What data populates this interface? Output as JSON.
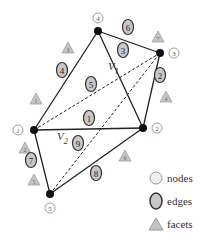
{
  "diagram": {
    "nodes": [
      {
        "id": "1",
        "label": "1",
        "x": 34,
        "y": 130,
        "lx": 18,
        "ly": 130
      },
      {
        "id": "2",
        "label": "2",
        "x": 143,
        "y": 128,
        "lx": 157,
        "ly": 128
      },
      {
        "id": "3",
        "label": "3",
        "x": 160,
        "y": 53,
        "lx": 174,
        "ly": 53
      },
      {
        "id": "4",
        "label": "4",
        "x": 98,
        "y": 31,
        "lx": 98,
        "ly": 18
      },
      {
        "id": "5",
        "label": "5",
        "x": 50,
        "y": 194,
        "lx": 50,
        "ly": 208
      }
    ],
    "edges": [
      {
        "id": "1",
        "label": "1",
        "from": "1",
        "to": "2",
        "style": "solid",
        "lx": 89,
        "ly": 118
      },
      {
        "id": "2",
        "label": "2",
        "from": "2",
        "to": "3",
        "style": "solid",
        "lx": 160,
        "ly": 75
      },
      {
        "id": "3",
        "label": "3",
        "from": "4",
        "to": "3",
        "style": "solid",
        "lx": 123,
        "ly": 50
      },
      {
        "id": "4",
        "label": "4",
        "from": "1",
        "to": "4",
        "style": "solid",
        "lx": 62,
        "ly": 70
      },
      {
        "id": "5",
        "label": "5",
        "from": "1",
        "to": "3",
        "style": "dashed",
        "lx": 91,
        "ly": 84
      },
      {
        "id": "6",
        "label": "6",
        "from": "4",
        "to": "2",
        "style": "solid",
        "lx": 128,
        "ly": 27
      },
      {
        "id": "7",
        "label": "7",
        "from": "1",
        "to": "5",
        "style": "solid",
        "lx": 31,
        "ly": 160
      },
      {
        "id": "8",
        "label": "8",
        "from": "5",
        "to": "2",
        "style": "solid",
        "lx": 96,
        "ly": 173
      },
      {
        "id": "9",
        "label": "9",
        "from": "5",
        "to": "3",
        "style": "dashed",
        "lx": 78,
        "ly": 143
      }
    ],
    "facets": [
      {
        "id": "1",
        "label": "1",
        "x": 36,
        "y": 99
      },
      {
        "id": "2",
        "label": "2",
        "x": 25,
        "y": 148
      },
      {
        "id": "3",
        "label": "3",
        "x": 68,
        "y": 48
      },
      {
        "id": "4",
        "label": "4",
        "x": 166,
        "y": 97
      },
      {
        "id": "5",
        "label": "5",
        "x": 34,
        "y": 180
      },
      {
        "id": "6",
        "label": "6",
        "x": 125,
        "y": 156
      },
      {
        "id": "7",
        "label": "7",
        "x": 158,
        "y": 37
      }
    ],
    "volumes": [
      {
        "label": "V",
        "sub": "1",
        "x": 108,
        "y": 70
      },
      {
        "label": "V",
        "sub": "2",
        "x": 57,
        "y": 140
      }
    ]
  },
  "legend": {
    "nodes_label": "nodes",
    "edges_label": "edges",
    "facets_label": "facets"
  },
  "colors": {
    "line": "#222222",
    "node_fill": "#111111",
    "edge_badge_fill": "#c8c8c8",
    "facet_fill": "#c4c4c4",
    "label_circle_stroke": "#888888"
  }
}
